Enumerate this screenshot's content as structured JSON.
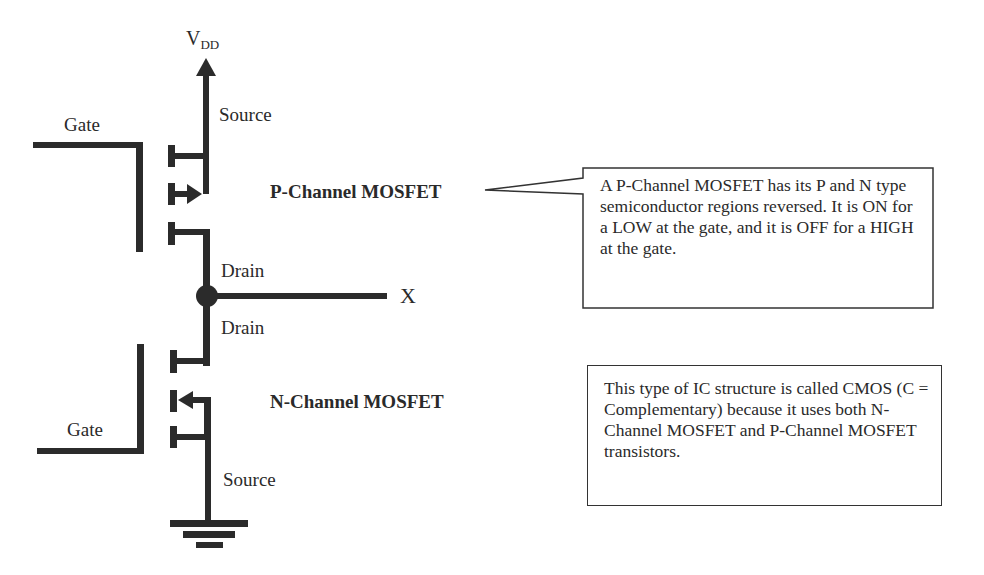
{
  "diagram": {
    "supply_label": "V",
    "supply_subscript": "DD",
    "output_label": "X",
    "p_mosfet": {
      "title": "P-Channel MOSFET",
      "gate_label": "Gate",
      "source_label": "Source",
      "drain_label": "Drain"
    },
    "n_mosfet": {
      "title": "N-Channel MOSFET",
      "gate_label": "Gate",
      "source_label": "Source",
      "drain_label": "Drain"
    },
    "callouts": [
      {
        "text": "A P-Channel MOSFET has its P and N type semiconductor regions reversed. It is ON for a LOW at the gate, and it is OFF for a HIGH at the gate."
      },
      {
        "text": "This type of IC structure is called CMOS (C = Complementary) because it uses both N-Channel MOSFET and P-Channel MOSFET transistors."
      }
    ],
    "colors": {
      "wire": "#2b2b2b",
      "text": "#2a2a2a",
      "box_border": "#333333",
      "background": "#ffffff"
    }
  }
}
